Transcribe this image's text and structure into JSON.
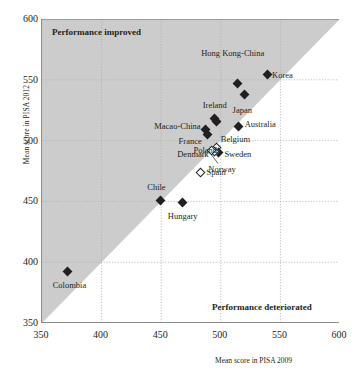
{
  "chart_data": {
    "type": "scatter",
    "title": "",
    "xlabel": "Mean score in PISA 2009",
    "ylabel": "Mean score in PISA 2012",
    "xlim": [
      350,
      600
    ],
    "ylim": [
      350,
      600
    ],
    "xticks": [
      350,
      400,
      450,
      500,
      550,
      600
    ],
    "yticks": [
      350,
      400,
      450,
      500,
      550,
      600
    ],
    "grid": true,
    "legend": "none",
    "annotations": [
      {
        "text": "Performance improved",
        "region": "upper-left"
      },
      {
        "text": "Performance deteriorated",
        "region": "lower-right"
      }
    ],
    "reference_line": {
      "type": "identity",
      "note": "y = x diagonal separating improved/deteriorated regions"
    },
    "marker_styles": {
      "filled": "statistically significant change",
      "hollow": "change not statistically significant"
    },
    "points": [
      {
        "label": "Korea",
        "x": 539,
        "y": 554,
        "marker": "filled",
        "label_pos": "l",
        "lx": 543,
        "ly": 554
      },
      {
        "label": "Hong Kong-China",
        "x": 514,
        "y": 547,
        "marker": "filled",
        "label_pos": "c",
        "lx": 510,
        "ly": 572
      },
      {
        "label": "Japan",
        "x": 520,
        "y": 538,
        "marker": "filled",
        "label_pos": "c",
        "lx": 518,
        "ly": 525
      },
      {
        "label": "Australia",
        "x": 515,
        "y": 512,
        "marker": "filled",
        "label_pos": "l",
        "lx": 520,
        "ly": 514
      },
      {
        "label": "Ireland",
        "x": 496,
        "y": 516,
        "marker": "filled",
        "label_pos": "c",
        "lx": 495,
        "ly": 529
      },
      {
        "label": "Macao-China",
        "x": 487,
        "y": 509,
        "marker": "filled",
        "label_pos": "r",
        "lx": 483,
        "ly": 512
      },
      {
        "label": "France",
        "x": 489,
        "y": 505,
        "marker": "filled",
        "label_pos": "r",
        "lx": 484,
        "ly": 500
      },
      {
        "label": "Belgium",
        "x": 496,
        "y": 494,
        "marker": "hollow",
        "label_pos": "l",
        "lx": 500,
        "ly": 501
      },
      {
        "label": "Sweden",
        "x": 498,
        "y": 490,
        "marker": "filled",
        "label_pos": "l",
        "lx": 503,
        "ly": 489
      },
      {
        "label": "Denmark",
        "x": 495,
        "y": 491,
        "marker": "hollow",
        "label_pos": "r",
        "lx": 490,
        "ly": 489
      },
      {
        "label": "Norway",
        "x": 492,
        "y": 492,
        "marker": "hollow",
        "label_pos": "c",
        "lx": 501,
        "ly": 477
      },
      {
        "label": "Poland",
        "x": 495,
        "y": 518,
        "marker": "filled",
        "label_pos": "c",
        "lx": 487,
        "ly": 492
      },
      {
        "label": "Spain",
        "x": 483,
        "y": 474,
        "marker": "hollow",
        "label_pos": "l",
        "lx": 488,
        "ly": 474
      },
      {
        "label": "Chile",
        "x": 449,
        "y": 451,
        "marker": "filled",
        "label_pos": "c",
        "lx": 446,
        "ly": 462
      },
      {
        "label": "Hungary",
        "x": 468,
        "y": 449,
        "marker": "filled",
        "label_pos": "c",
        "lx": 468,
        "ly": 438
      },
      {
        "label": "Colombia",
        "x": 371,
        "y": 392,
        "marker": "filled",
        "label_pos": "c",
        "lx": 373,
        "ly": 381
      }
    ]
  },
  "axes": {
    "x_label": "Mean score in PISA 2009",
    "y_label": "Mean score in PISA 2012",
    "x_ticks": [
      "350",
      "400",
      "450",
      "500",
      "550",
      "600"
    ],
    "y_ticks": [
      "600",
      "550",
      "500",
      "450",
      "400",
      "350"
    ]
  },
  "regions": {
    "improved": "Performance improved",
    "deteriorated": "Performance deteriorated"
  },
  "colors": {
    "shaded_region": "#cccccc",
    "marker_fill": "#231f20",
    "grid": "#b0b0b0",
    "axis": "#8d8d8d"
  }
}
